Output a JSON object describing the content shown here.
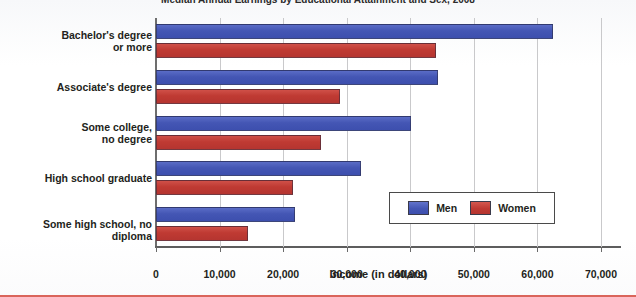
{
  "chart_data": {
    "type": "bar",
    "orientation": "horizontal",
    "title": "Median Annual Earnings by Educational Attainment and Sex, 2008",
    "xlabel": "Income (in dollars)",
    "ylabel": "",
    "xlim": [
      0,
      70000
    ],
    "xticks": [
      0,
      10000,
      20000,
      30000,
      40000,
      50000,
      60000,
      70000
    ],
    "xticklabels": [
      "0",
      "10,000",
      "20,000",
      "30,000",
      "40,000",
      "50,000",
      "60,000",
      "70,000"
    ],
    "grid": "vertical",
    "legend_position": "inside-lower-right",
    "categories": [
      "Bachelor's degree\nor more",
      "Associate's degree",
      "Some college,\nno degree",
      "High school graduate",
      "Some high school, no diploma"
    ],
    "series": [
      {
        "name": "Men",
        "color": "#4456b4",
        "values": [
          62400,
          44300,
          40100,
          32200,
          21900
        ]
      },
      {
        "name": "Women",
        "color": "#bf3a33",
        "values": [
          44000,
          29000,
          25900,
          21500,
          14500
        ]
      }
    ]
  },
  "legend": {
    "entries": [
      {
        "label": "Men"
      },
      {
        "label": "Women"
      }
    ]
  },
  "categories_display": [
    {
      "line1": "Bachelor's degree",
      "line2": "or more"
    },
    {
      "line1": "Associate's degree",
      "line2": ""
    },
    {
      "line1": "Some college,",
      "line2": "no degree"
    },
    {
      "line1": "High school graduate",
      "line2": ""
    },
    {
      "line1": "Some high school, no diploma",
      "line2": ""
    }
  ],
  "colors": {
    "men": "#4456b4",
    "women": "#bf3a33",
    "grid": "#c9c9cb",
    "axis": "#5d5d5d",
    "text": "#231f20"
  }
}
